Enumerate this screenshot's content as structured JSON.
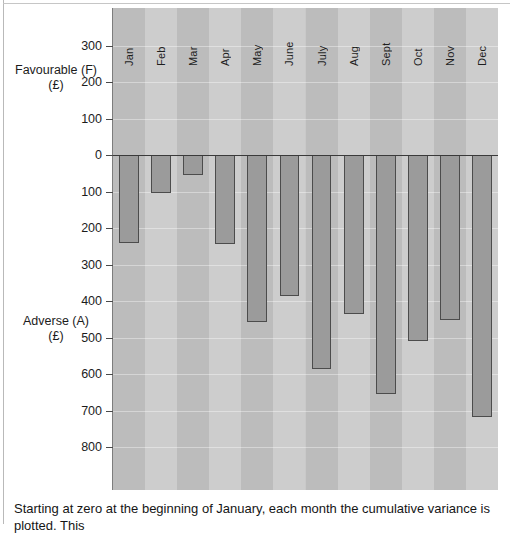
{
  "chart_data": {
    "type": "bar",
    "title": "",
    "categories": [
      "Jan",
      "Feb",
      "Mar",
      "Apr",
      "May",
      "June",
      "July",
      "Aug",
      "Sept",
      "Oct",
      "Nov",
      "Dec"
    ],
    "values": [
      -240,
      -105,
      -55,
      -245,
      -458,
      -385,
      -585,
      -435,
      -655,
      -510,
      -452,
      -718
    ],
    "value_note": "Cumulative variance plotted downward as Adverse (A); axis labels show magnitude without sign",
    "xlabel": "",
    "ylabel": "Favourable (F) (£) / Adverse (A) (£)",
    "ytick_labels": [
      "300",
      "200",
      "100",
      "0",
      "100",
      "200",
      "300",
      "400",
      "500",
      "600",
      "700",
      "800"
    ],
    "ytick_values": [
      300,
      200,
      100,
      0,
      -100,
      -200,
      -300,
      -400,
      -500,
      -600,
      -700,
      -800
    ],
    "ylim": [
      -860,
      350
    ],
    "grid": true,
    "legend": "none",
    "bar_fill_color": "#9b9b9b",
    "bar_edge_color": "#4c4c4c",
    "plot_background_color": "#c9c9c9",
    "band_color": "#bcbcbc"
  },
  "axis_labels": {
    "favourable_main": "Favourable (F)",
    "favourable_sub": "(£)",
    "adverse_main": "Adverse (A)",
    "adverse_sub": "(£)"
  },
  "caption": {
    "text": "Starting at zero at the beginning of January, each month the cumulative variance is plotted. This"
  }
}
